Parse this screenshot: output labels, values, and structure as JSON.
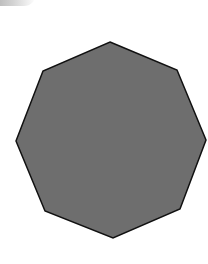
{
  "figure": {
    "shape": "octagon",
    "fill_color": "#6e6e6e",
    "stroke_color": "#111111",
    "points": "110,42 177,70 206,140 180,209 113,238 45,211 16,141 43,71"
  }
}
